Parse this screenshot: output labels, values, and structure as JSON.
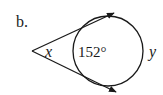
{
  "figure": {
    "part_label": "b.",
    "vertex_angle_label": "x",
    "near_arc_label": "152°",
    "far_arc_label": "y",
    "stroke_color": "#1a1a1a",
    "background": "#ffffff"
  }
}
